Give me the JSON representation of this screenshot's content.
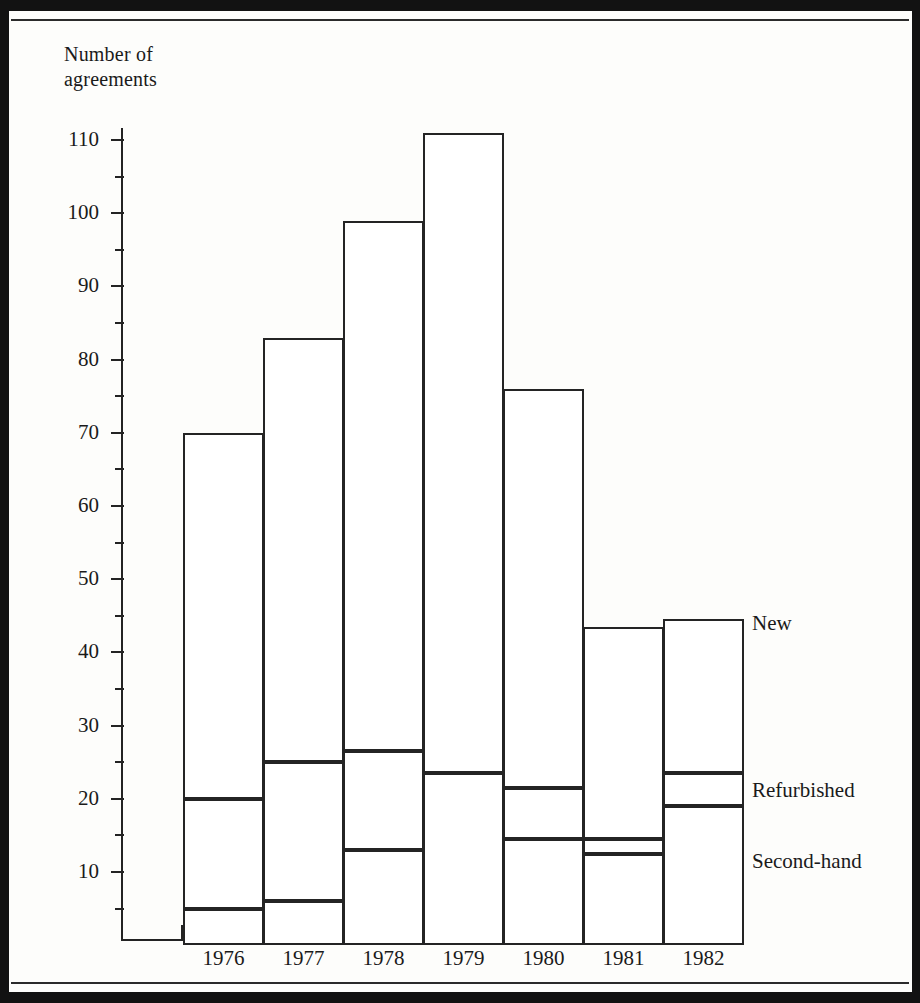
{
  "figure": {
    "y_axis_title": "Number of\nagreements"
  },
  "chart_data": {
    "type": "bar",
    "subtype": "stacked-vertical",
    "title": "",
    "xlabel": "",
    "ylabel": "Number of agreements",
    "categories": [
      "1976",
      "1977",
      "1978",
      "1979",
      "1980",
      "1981",
      "1982"
    ],
    "ylim": [
      0,
      115
    ],
    "ytick_major": [
      10,
      20,
      30,
      40,
      50,
      60,
      70,
      80,
      90,
      100,
      110
    ],
    "ytick_minor": [
      5,
      15,
      25,
      35,
      45,
      55,
      65,
      75,
      85,
      95,
      105,
      115
    ],
    "grid": false,
    "legend_position": "right-inline",
    "series": [
      {
        "name": "Second-hand",
        "values": [
          5,
          6,
          13,
          0,
          14.5,
          12.5,
          19
        ]
      },
      {
        "name": "Refurbished",
        "values": [
          15,
          19,
          13.5,
          23.5,
          7,
          2,
          4.5
        ]
      },
      {
        "name": "New",
        "values": [
          50,
          58,
          72.5,
          87.5,
          54.5,
          29,
          21
        ]
      }
    ],
    "cumulative_tops": {
      "1976": [
        5,
        20,
        70
      ],
      "1977": [
        6,
        25,
        83
      ],
      "1978": [
        13,
        26.5,
        99
      ],
      "1979": [
        0,
        23.5,
        111
      ],
      "1980": [
        14.5,
        21.5,
        76
      ],
      "1981": [
        12.5,
        14.5,
        43.5
      ],
      "1982": [
        19,
        23.5,
        44.5
      ]
    },
    "totals": [
      70,
      83,
      99,
      111,
      76,
      43.5,
      44.5
    ]
  },
  "legend": {
    "items": [
      {
        "label": "New"
      },
      {
        "label": "Refurbished"
      },
      {
        "label": "Second-hand"
      }
    ]
  }
}
